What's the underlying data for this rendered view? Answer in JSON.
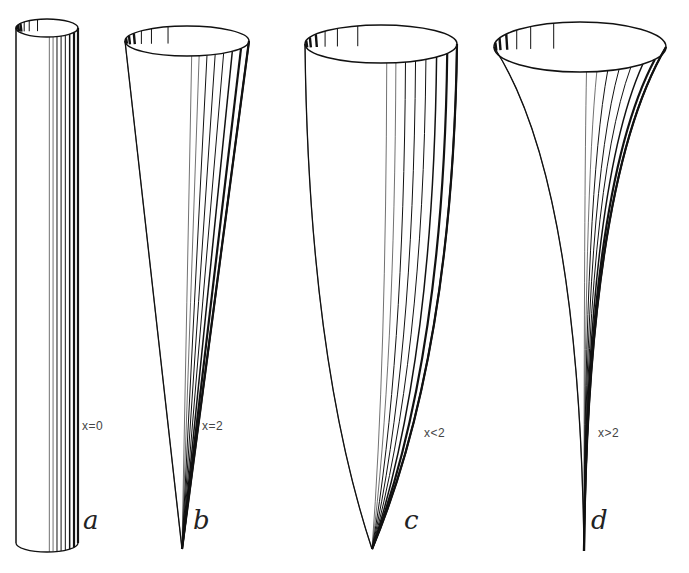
{
  "figure": {
    "panels": [
      {
        "id": "a",
        "letter": "a",
        "condition": "x=0",
        "shape": "cylinder",
        "rim": {
          "cx": 47,
          "cy": 28,
          "rx": 31,
          "ry": 9
        },
        "bottom": {
          "cx": 47,
          "cy": 543,
          "rx": 31,
          "ry": 9
        },
        "apex": null,
        "label_pos": {
          "x": 82,
          "y": 419
        },
        "letter_pos": {
          "x": 83,
          "y": 505
        }
      },
      {
        "id": "b",
        "letter": "b",
        "condition": "x=2",
        "shape": "cone",
        "rim": {
          "cx": 187,
          "cy": 41,
          "rx": 62,
          "ry": 15
        },
        "apex": {
          "x": 182,
          "y": 549
        },
        "label_pos": {
          "x": 202,
          "y": 419
        },
        "letter_pos": {
          "x": 193,
          "y": 505
        }
      },
      {
        "id": "c",
        "letter": "c",
        "condition": "x<2",
        "shape": "convex",
        "rim": {
          "cx": 381,
          "cy": 44,
          "rx": 76,
          "ry": 19
        },
        "apex": {
          "x": 372,
          "y": 549
        },
        "label_pos": {
          "x": 424,
          "y": 426
        },
        "letter_pos": {
          "x": 404,
          "y": 505
        }
      },
      {
        "id": "d",
        "letter": "d",
        "condition": "x>2",
        "shape": "concave",
        "rim": {
          "cx": 580,
          "cy": 47,
          "rx": 86,
          "ry": 25
        },
        "apex": {
          "x": 584,
          "y": 551
        },
        "label_pos": {
          "x": 598,
          "y": 426
        },
        "letter_pos": {
          "x": 591,
          "y": 505
        }
      }
    ],
    "colors": {
      "stroke": "#111111",
      "light_stroke": "#888888",
      "background": "#ffffff",
      "text": "#444444"
    }
  }
}
